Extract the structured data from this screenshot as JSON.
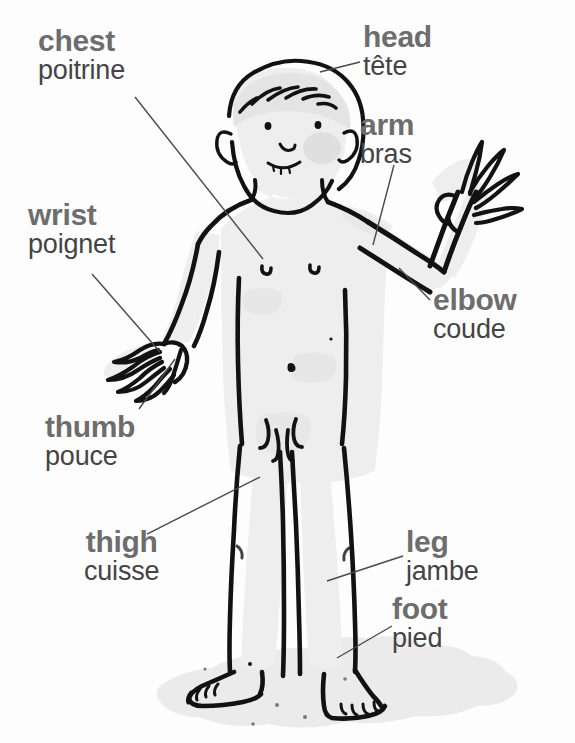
{
  "colors": {
    "english_label": "#6d6d6d",
    "french_label": "#444444",
    "outline": "#121212",
    "skin_wash": "#eeeeee",
    "ground_shadow": "#e0e0e0",
    "leader_line": "#4a4a4a",
    "background": "#fdfdfd"
  },
  "labels": [
    {
      "id": "chest",
      "en": "chest",
      "fr": "poitrine",
      "points_to": "chest"
    },
    {
      "id": "head",
      "en": "head",
      "fr": "tête",
      "points_to": "head"
    },
    {
      "id": "arm",
      "en": "arm",
      "fr": "bras",
      "points_to": "upper-arm"
    },
    {
      "id": "elbow",
      "en": "elbow",
      "fr": "coude",
      "points_to": "elbow"
    },
    {
      "id": "wrist",
      "en": "wrist",
      "fr": "poignet",
      "points_to": "wrist"
    },
    {
      "id": "thumb",
      "en": "thumb",
      "fr": "pouce",
      "points_to": "thumb"
    },
    {
      "id": "thigh",
      "en": "thigh",
      "fr": "cuisse",
      "points_to": "thigh"
    },
    {
      "id": "leg",
      "en": "leg",
      "fr": "jambe",
      "points_to": "lower-leg"
    },
    {
      "id": "foot",
      "en": "foot",
      "fr": "pied",
      "points_to": "foot"
    }
  ],
  "figure": {
    "style": "black ink line drawing with light grey watercolour wash"
  }
}
